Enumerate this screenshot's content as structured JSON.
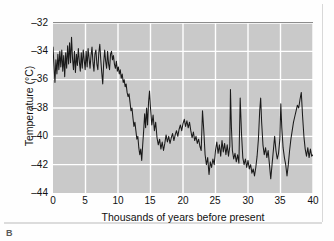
{
  "figure": {
    "panel_label": "B"
  },
  "chart_data": {
    "type": "line",
    "title": "",
    "xlabel": "Thousands of years before present",
    "ylabel": "Temperature (°C)",
    "xlim": [
      0,
      40
    ],
    "ylim": [
      -44,
      -32
    ],
    "xticks": [
      0,
      5,
      10,
      15,
      20,
      25,
      30,
      35,
      40
    ],
    "yticks": [
      -32,
      -34,
      -36,
      -38,
      -40,
      -42,
      -44
    ],
    "xtick_labels": [
      "0",
      "5",
      "10",
      "15",
      "20",
      "25",
      "30",
      "35",
      "40"
    ],
    "ytick_labels": [
      "–32",
      "–34",
      "–36",
      "–38",
      "–40",
      "–42",
      "–44"
    ],
    "grid": true,
    "grid_color": "#ffffff",
    "plot_background": "#c9c9c9",
    "line_color": "#1a1a1a",
    "legend": null,
    "series": [
      {
        "name": "Greenland ice-core temperature",
        "x": [
          0.0,
          0.15,
          0.3,
          0.45,
          0.6,
          0.75,
          0.9,
          1.05,
          1.2,
          1.35,
          1.5,
          1.65,
          1.8,
          1.95,
          2.1,
          2.25,
          2.4,
          2.55,
          2.7,
          2.85,
          3.0,
          3.15,
          3.3,
          3.45,
          3.6,
          3.75,
          3.9,
          4.05,
          4.2,
          4.35,
          4.5,
          4.65,
          4.8,
          4.95,
          5.1,
          5.25,
          5.4,
          5.55,
          5.7,
          5.85,
          6.0,
          6.15,
          6.3,
          6.45,
          6.6,
          6.75,
          6.9,
          7.05,
          7.2,
          7.35,
          7.5,
          7.65,
          7.8,
          7.95,
          8.1,
          8.25,
          8.4,
          8.55,
          8.7,
          8.85,
          9.0,
          9.15,
          9.3,
          9.45,
          9.6,
          9.75,
          9.9,
          10.05,
          10.2,
          10.35,
          10.5,
          10.65,
          10.8,
          10.95,
          11.1,
          11.25,
          11.4,
          11.55,
          11.7,
          11.85,
          12.0,
          12.15,
          12.3,
          12.45,
          12.6,
          12.75,
          12.9,
          13.05,
          13.2,
          13.35,
          13.5,
          13.65,
          13.8,
          13.95,
          14.1,
          14.25,
          14.4,
          14.55,
          14.7,
          14.85,
          15.0,
          15.2,
          15.4,
          15.6,
          15.8,
          16.0,
          16.2,
          16.4,
          16.6,
          16.8,
          17.0,
          17.2,
          17.4,
          17.6,
          17.8,
          18.0,
          18.2,
          18.4,
          18.6,
          18.8,
          19.0,
          19.2,
          19.4,
          19.6,
          19.8,
          20.0,
          20.2,
          20.4,
          20.6,
          20.8,
          21.0,
          21.2,
          21.4,
          21.6,
          21.8,
          22.0,
          22.2,
          22.4,
          22.6,
          22.8,
          23.0,
          23.2,
          23.4,
          23.6,
          23.8,
          24.0,
          24.2,
          24.4,
          24.6,
          24.8,
          25.0,
          25.2,
          25.4,
          25.6,
          25.8,
          26.0,
          26.2,
          26.4,
          26.6,
          26.8,
          27.0,
          27.2,
          27.3,
          27.45,
          27.6,
          27.8,
          28.0,
          28.2,
          28.4,
          28.6,
          28.8,
          29.0,
          29.2,
          29.4,
          29.6,
          29.8,
          30.0,
          30.2,
          30.4,
          30.6,
          30.8,
          31.0,
          31.2,
          31.4,
          31.6,
          31.8,
          31.95,
          32.1,
          32.3,
          32.5,
          32.7,
          32.9,
          33.1,
          33.3,
          33.5,
          33.7,
          33.9,
          34.1,
          34.3,
          34.5,
          34.7,
          34.9,
          35.05,
          35.2,
          35.4,
          35.6,
          35.8,
          36.0,
          36.2,
          36.4,
          36.6,
          36.8,
          37.0,
          37.2,
          37.4,
          37.6,
          37.8,
          38.0,
          38.2,
          38.4,
          38.6,
          38.8,
          39.0,
          39.2,
          39.4,
          39.6,
          39.8,
          40.0
        ],
        "y": [
          -33.7,
          -35.0,
          -36.2,
          -34.6,
          -35.6,
          -34.2,
          -35.3,
          -34.0,
          -35.1,
          -33.9,
          -35.4,
          -34.3,
          -35.8,
          -34.1,
          -35.2,
          -33.6,
          -34.9,
          -33.4,
          -34.8,
          -33.0,
          -34.5,
          -35.3,
          -34.0,
          -35.5,
          -34.2,
          -35.0,
          -33.8,
          -34.7,
          -35.4,
          -34.1,
          -35.2,
          -33.9,
          -34.6,
          -35.3,
          -34.0,
          -35.1,
          -33.8,
          -34.5,
          -35.2,
          -34.3,
          -33.7,
          -34.8,
          -35.4,
          -34.2,
          -33.9,
          -34.9,
          -35.3,
          -34.1,
          -33.5,
          -34.6,
          -35.5,
          -36.3,
          -34.8,
          -33.9,
          -34.7,
          -35.2,
          -34.0,
          -34.9,
          -35.3,
          -34.2,
          -34.0,
          -34.6,
          -34.3,
          -34.9,
          -35.2,
          -34.7,
          -35.4,
          -35.1,
          -35.6,
          -35.3,
          -35.9,
          -35.6,
          -36.2,
          -36.0,
          -36.5,
          -36.3,
          -36.9,
          -37.2,
          -37.0,
          -37.6,
          -38.2,
          -38.0,
          -38.7,
          -39.3,
          -39.0,
          -39.6,
          -40.2,
          -40.0,
          -40.8,
          -41.3,
          -40.9,
          -41.7,
          -40.6,
          -39.6,
          -38.4,
          -39.4,
          -38.0,
          -39.2,
          -37.6,
          -36.8,
          -38.0,
          -39.2,
          -38.5,
          -39.6,
          -39.0,
          -40.1,
          -40.6,
          -40.2,
          -40.9,
          -40.4,
          -41.0,
          -40.5,
          -39.9,
          -40.4,
          -40.0,
          -40.5,
          -40.1,
          -39.8,
          -40.3,
          -39.9,
          -39.6,
          -40.0,
          -39.5,
          -39.2,
          -39.6,
          -39.1,
          -38.8,
          -39.3,
          -38.9,
          -39.4,
          -39.0,
          -39.6,
          -40.1,
          -39.7,
          -40.3,
          -40.0,
          -40.5,
          -40.2,
          -40.7,
          -41.0,
          -38.2,
          -39.6,
          -41.3,
          -42.0,
          -41.5,
          -42.7,
          -41.8,
          -42.2,
          -41.6,
          -42.0,
          -41.0,
          -40.4,
          -41.2,
          -40.6,
          -41.4,
          -40.3,
          -41.1,
          -40.5,
          -41.3,
          -40.6,
          -41.4,
          -40.7,
          -36.7,
          -39.4,
          -41.0,
          -41.6,
          -41.2,
          -41.8,
          -41.3,
          -41.9,
          -37.3,
          -39.8,
          -41.5,
          -42.0,
          -41.6,
          -42.2,
          -41.7,
          -42.3,
          -42.0,
          -42.6,
          -42.3,
          -42.8,
          -42.2,
          -41.4,
          -40.2,
          -38.2,
          -37.3,
          -39.0,
          -40.6,
          -41.3,
          -40.8,
          -41.5,
          -41.0,
          -42.0,
          -43.0,
          -42.0,
          -41.0,
          -40.0,
          -41.0,
          -41.6,
          -41.2,
          -40.2,
          -37.7,
          -39.4,
          -40.8,
          -41.5,
          -42.0,
          -42.8,
          -42.0,
          -41.0,
          -40.2,
          -39.6,
          -39.0,
          -38.6,
          -38.2,
          -37.8,
          -38.0,
          -37.4,
          -36.9,
          -38.6,
          -40.0,
          -40.9,
          -41.4,
          -40.8,
          -41.5,
          -40.9,
          -41.4,
          -41.3
        ]
      }
    ]
  }
}
